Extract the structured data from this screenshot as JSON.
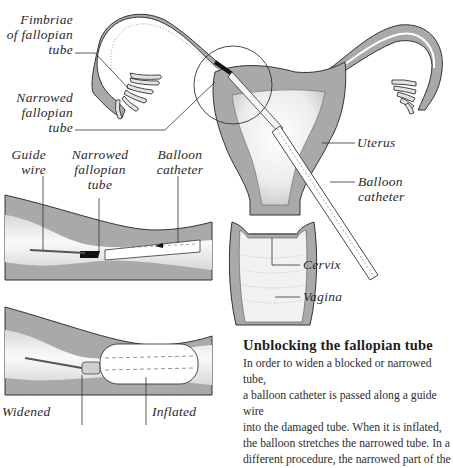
{
  "labels": {
    "fimbriae": "Fimbriae\nof fallopian\ntube",
    "narrowed_main": "Narrowed\nfallopian\ntube",
    "uterus": "Uterus",
    "balloon_catheter_main": "Balloon catheter",
    "cervix": "Cervix",
    "vagina": "Vagina",
    "guide_wire": "Guide\nwire",
    "narrowed_inset": "Narrowed\nfallopian\ntube",
    "balloon_catheter_inset": "Balloon\ncatheter",
    "widened": "Widened",
    "inflated": "Inflated"
  },
  "caption": {
    "title": "Unblocking the fallopian tube",
    "body": "In order to widen a blocked or narrowed tube,\na balloon catheter is passed along a guide wire\ninto the damaged tube. When it is inflated,\nthe balloon stretches the narrowed tube. In a\ndifferent procedure, the narrowed part of the"
  },
  "colors": {
    "tissue_gray": "#a9a9a9",
    "light_fill": "#ececec",
    "outline": "#333333",
    "background": "#ffffff"
  }
}
